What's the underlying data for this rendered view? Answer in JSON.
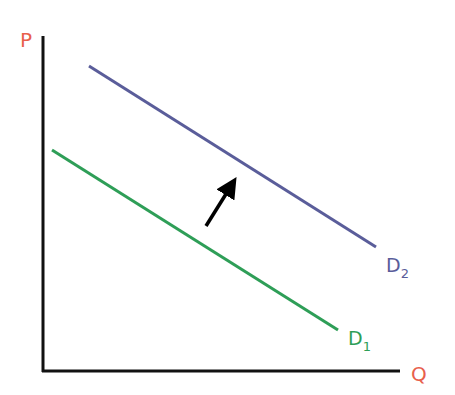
{
  "diagram": {
    "axes": {
      "y_label": "P",
      "x_label": "Q",
      "label_color": "#e8604c",
      "axis_color": "#111111"
    },
    "curves": [
      {
        "id": "d1",
        "label": "D",
        "subscript": "1",
        "color": "#2e9e57",
        "x1": 52,
        "y1": 150,
        "x2": 338,
        "y2": 330
      },
      {
        "id": "d2",
        "label": "D",
        "subscript": "2",
        "color": "#5a5d9a",
        "x1": 89,
        "y1": 66,
        "x2": 376,
        "y2": 247
      }
    ],
    "shift_arrow": {
      "direction": "up-right",
      "color": "#000000"
    }
  }
}
